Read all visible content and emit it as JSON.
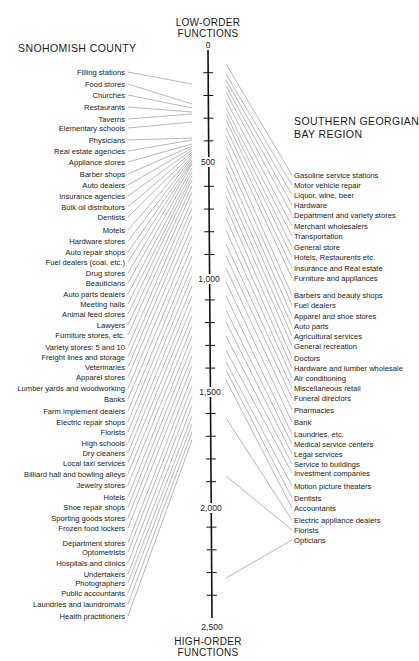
{
  "header": {
    "low_order": [
      "LOW-ORDER",
      "FUNCTIONS"
    ],
    "high_order": [
      "HIGH-ORDER",
      "FUNCTIONS"
    ],
    "left_region": "SNOHOMISH COUNTY",
    "right_region": [
      "SOUTHERN GEORGIAN",
      "BAY REGION"
    ]
  },
  "axis": {
    "ticks": [
      "0",
      "500",
      "1,000",
      "1,500",
      "2,000",
      "2,500"
    ],
    "min": 0,
    "max": 2500,
    "minor_step": 100
  },
  "colors": {
    "line": "#9a9a9a",
    "axis": "#111111",
    "text": "#1a1a1a"
  },
  "left": {
    "items": [
      {
        "label": "Filling stations",
        "y": 72,
        "end": 84
      },
      {
        "label": "Food stores",
        "y": 84,
        "end": 104
      },
      {
        "label": "Churches",
        "y": 95,
        "end": 108
      },
      {
        "label": "Restaurants",
        "y": 107,
        "end": 112
      },
      {
        "label": "Taverns",
        "y": 119,
        "end": 114
      },
      {
        "label": "Elementary schools",
        "y": 128,
        "end": 122
      },
      {
        "label": "Physicians",
        "y": 140,
        "end": 138
      },
      {
        "label": "Real estate agencies",
        "y": 151,
        "end": 140
      },
      {
        "label": "Appliance stores",
        "y": 162,
        "end": 144
      },
      {
        "label": "Barber shops",
        "y": 174,
        "end": 146
      },
      {
        "label": "Auto dealers",
        "y": 185,
        "end": 148
      },
      {
        "label": "Insurance agencies",
        "y": 196,
        "end": 150
      },
      {
        "label": "Bulk oil distributors",
        "y": 207,
        "end": 152
      },
      {
        "label": "Dentists",
        "y": 217,
        "end": 154
      },
      {
        "label": "Motels",
        "y": 230,
        "end": 156
      },
      {
        "label": "Hardware stores",
        "y": 241,
        "end": 158
      },
      {
        "label": "Auto repair shops",
        "y": 252,
        "end": 160
      },
      {
        "label": "Fuel dealers (coal, etc.)",
        "y": 262,
        "end": 162
      },
      {
        "label": "Drug stores",
        "y": 273,
        "end": 164
      },
      {
        "label": "Beauticians",
        "y": 283,
        "end": 168
      },
      {
        "label": "Auto parts dealers",
        "y": 294,
        "end": 172
      },
      {
        "label": "Meeting halls",
        "y": 304,
        "end": 176
      },
      {
        "label": "Animal feed stores",
        "y": 314,
        "end": 180
      },
      {
        "label": "Lawyers",
        "y": 325,
        "end": 186
      },
      {
        "label": "Furniture stores, etc.",
        "y": 335,
        "end": 192
      },
      {
        "label": "Variety stores: 5 and 10",
        "y": 347,
        "end": 200
      },
      {
        "label": "Freight lines and storage",
        "y": 357,
        "end": 208
      },
      {
        "label": "Veterinaries",
        "y": 367,
        "end": 216
      },
      {
        "label": "Apparel stores",
        "y": 377,
        "end": 226
      },
      {
        "label": "Lumber yards and woodworking",
        "y": 388,
        "end": 236
      },
      {
        "label": "Banks",
        "y": 399,
        "end": 246
      },
      {
        "label": "Farm implement dealers",
        "y": 411,
        "end": 256
      },
      {
        "label": "Electric repair shops",
        "y": 422,
        "end": 266
      },
      {
        "label": "Florists",
        "y": 432,
        "end": 276
      },
      {
        "label": "High schools",
        "y": 443,
        "end": 286
      },
      {
        "label": "Dry cleaners",
        "y": 453,
        "end": 296
      },
      {
        "label": "Local taxi services",
        "y": 463,
        "end": 306
      },
      {
        "label": "Billiard hall and bowling alleys",
        "y": 474,
        "end": 316
      },
      {
        "label": "Jewelry stores",
        "y": 485,
        "end": 326
      },
      {
        "label": "Hotels",
        "y": 497,
        "end": 336
      },
      {
        "label": "Shoe repair shops",
        "y": 507,
        "end": 346
      },
      {
        "label": "Sporting goods stores",
        "y": 518,
        "end": 356
      },
      {
        "label": "Frozen food lockers",
        "y": 528,
        "end": 366
      },
      {
        "label": "Department stores",
        "y": 543,
        "end": 376
      },
      {
        "label": "Optometrists",
        "y": 552,
        "end": 386
      },
      {
        "label": "Hospitals and clinics",
        "y": 563,
        "end": 396
      },
      {
        "label": "Undertakers",
        "y": 574,
        "end": 406
      },
      {
        "label": "Photographers",
        "y": 583,
        "end": 416
      },
      {
        "label": "Public accountants",
        "y": 593,
        "end": 424
      },
      {
        "label": "Laundries and laundromats",
        "y": 604,
        "end": 432
      },
      {
        "label": "Health practitioners",
        "y": 616,
        "end": 440
      }
    ]
  },
  "right": {
    "items": [
      {
        "label": "Gasoline service stations",
        "y": 175,
        "start": 64
      },
      {
        "label": "Motor vehicle repair",
        "y": 185,
        "start": 74
      },
      {
        "label": "Liquor, wine, beer",
        "y": 195,
        "start": 80
      },
      {
        "label": "Hardware",
        "y": 205,
        "start": 86
      },
      {
        "label": "Department and variety stores",
        "y": 215,
        "start": 92
      },
      {
        "label": "Merchant wholesalers",
        "y": 226,
        "start": 100
      },
      {
        "label": "Transportation",
        "y": 236,
        "start": 108
      },
      {
        "label": "General store",
        "y": 247,
        "start": 114
      },
      {
        "label": "Hotels, Restaurents etc.",
        "y": 257,
        "start": 120
      },
      {
        "label": "Insurance and Real estate",
        "y": 268,
        "start": 128
      },
      {
        "label": "Furniture and appliances",
        "y": 278,
        "start": 136
      },
      {
        "label": "Barbers and beauty shops",
        "y": 295,
        "start": 146
      },
      {
        "label": "Fuel dealers",
        "y": 305,
        "start": 156
      },
      {
        "label": "Apparel and shoe stores",
        "y": 316,
        "start": 166
      },
      {
        "label": "Auto parts",
        "y": 326,
        "start": 176
      },
      {
        "label": "Agricultural services",
        "y": 336,
        "start": 186
      },
      {
        "label": "General recreation",
        "y": 346,
        "start": 196
      },
      {
        "label": "Doctors",
        "y": 358,
        "start": 206
      },
      {
        "label": "Hardware and lumber wholesale",
        "y": 368,
        "start": 218
      },
      {
        "label": "Air conditioning",
        "y": 378,
        "start": 230
      },
      {
        "label": "Miscellaneous retail",
        "y": 388,
        "start": 244
      },
      {
        "label": "Funeral directors",
        "y": 398,
        "start": 256
      },
      {
        "label": "Pharmacies",
        "y": 410,
        "start": 268
      },
      {
        "label": "Bank",
        "y": 422,
        "start": 282
      },
      {
        "label": "Laundries, etc.",
        "y": 434,
        "start": 296
      },
      {
        "label": "Medical service centers",
        "y": 444,
        "start": 310
      },
      {
        "label": "Legal services",
        "y": 454,
        "start": 322
      },
      {
        "label": "Service to buildings",
        "y": 464,
        "start": 336
      },
      {
        "label": "Investment companies",
        "y": 473,
        "start": 350
      },
      {
        "label": "Motion picture theaters",
        "y": 486,
        "start": 362
      },
      {
        "label": "Dentists",
        "y": 498,
        "start": 370
      },
      {
        "label": "Accountants",
        "y": 508,
        "start": 380
      },
      {
        "label": "Electric appliance dealers",
        "y": 520,
        "start": 418
      },
      {
        "label": "Florists",
        "y": 530,
        "start": 476
      },
      {
        "label": "Opticians",
        "y": 540,
        "start": 578
      }
    ]
  }
}
